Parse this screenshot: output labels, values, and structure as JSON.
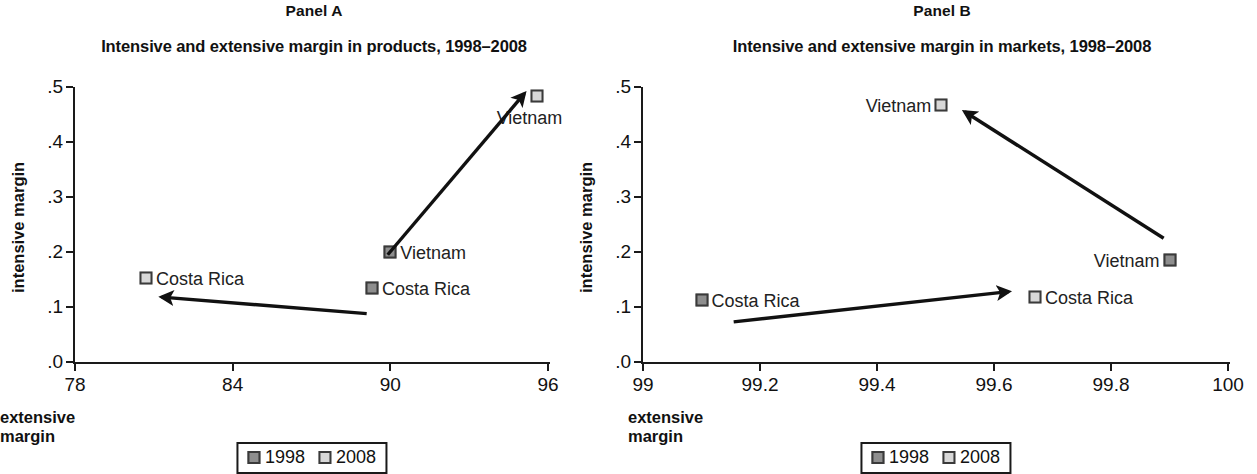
{
  "figure": {
    "background": "#ffffff",
    "marker_colors": {
      "y1998": "#8e8e8e",
      "y2008": "#d8d8d8",
      "border": "#3a3a3a"
    },
    "axis_color": "#1a1a1a"
  },
  "panels": [
    {
      "id": "panel-a",
      "label": "Panel A",
      "title": "Intensive and extensive margin in products, 1998–2008",
      "xlabel": "extensive margin",
      "ylabel": "intensive margin"
    },
    {
      "id": "panel-b",
      "label": "Panel B",
      "title": "Intensive and extensive margin in markets, 1998–2008",
      "xlabel": "extensive margin",
      "ylabel": "intensive margin"
    }
  ],
  "legend": {
    "entries": [
      {
        "label": "1998",
        "color": "#8e8e8e"
      },
      {
        "label": "2008",
        "color": "#d8d8d8"
      }
    ]
  },
  "chart_data": [
    {
      "type": "scatter",
      "panel": "Panel A",
      "title": "Intensive and extensive margin in products, 1998–2008",
      "xlabel": "extensive margin",
      "ylabel": "intensive margin",
      "xlim": [
        78,
        96
      ],
      "ylim": [
        0.0,
        0.5
      ],
      "xticks": [
        78,
        84,
        90,
        96
      ],
      "xticklabels": [
        "78",
        "84",
        "90",
        "96"
      ],
      "yticks": [
        0.0,
        0.1,
        0.2,
        0.3,
        0.4,
        0.5
      ],
      "yticklabels": [
        ".0",
        ".1",
        ".2",
        ".3",
        ".4",
        ".5"
      ],
      "grid": false,
      "legend_position": "below-center",
      "series": [
        {
          "name": "1998",
          "color": "#8e8e8e",
          "points": [
            {
              "label": "Vietnam",
              "x": 90.0,
              "y": 0.2,
              "label_side": "right"
            },
            {
              "label": "Costa Rica",
              "x": 89.3,
              "y": 0.135,
              "label_side": "right"
            }
          ]
        },
        {
          "name": "2008",
          "color": "#d8d8d8",
          "points": [
            {
              "label": "Vietnam",
              "x": 95.6,
              "y": 0.483,
              "label_side": "below"
            },
            {
              "label": "Costa Rica",
              "x": 80.7,
              "y": 0.152,
              "label_side": "right"
            }
          ]
        }
      ],
      "annotations": [
        {
          "type": "arrow",
          "name": "vietnam-arrow",
          "from": {
            "x": 89.9,
            "y": 0.195
          },
          "to": {
            "x": 95.1,
            "y": 0.488
          }
        },
        {
          "type": "arrow",
          "name": "costa-rica-arrow",
          "from": {
            "x": 89.1,
            "y": 0.088
          },
          "to": {
            "x": 81.3,
            "y": 0.118
          }
        }
      ]
    },
    {
      "type": "scatter",
      "panel": "Panel B",
      "title": "Intensive and extensive margin in markets, 1998–2008",
      "xlabel": "extensive margin",
      "ylabel": "intensive margin",
      "xlim": [
        99,
        100
      ],
      "ylim": [
        0.0,
        0.5
      ],
      "xticks": [
        99,
        99.2,
        99.4,
        99.6,
        99.8,
        100
      ],
      "xticklabels": [
        "99",
        "99.2",
        "99.4",
        "99.6",
        "99.8",
        "100"
      ],
      "yticks": [
        0.0,
        0.1,
        0.2,
        0.3,
        0.4,
        0.5
      ],
      "yticklabels": [
        ".0",
        ".1",
        ".2",
        ".3",
        ".4",
        ".5"
      ],
      "grid": false,
      "legend_position": "below-center",
      "series": [
        {
          "name": "1998",
          "color": "#8e8e8e",
          "points": [
            {
              "label": "Vietnam",
              "x": 99.9,
              "y": 0.185,
              "label_side": "left"
            },
            {
              "label": "Costa Rica",
              "x": 99.1,
              "y": 0.113,
              "label_side": "right"
            }
          ]
        },
        {
          "name": "2008",
          "color": "#d8d8d8",
          "points": [
            {
              "label": "Vietnam",
              "x": 99.51,
              "y": 0.468,
              "label_side": "left"
            },
            {
              "label": "Costa Rica",
              "x": 99.67,
              "y": 0.118,
              "label_side": "right"
            }
          ]
        }
      ],
      "annotations": [
        {
          "type": "arrow",
          "name": "vietnam-arrow",
          "from": {
            "x": 99.89,
            "y": 0.225
          },
          "to": {
            "x": 99.55,
            "y": 0.455
          }
        },
        {
          "type": "arrow",
          "name": "costa-rica-arrow",
          "from": {
            "x": 99.155,
            "y": 0.073
          },
          "to": {
            "x": 99.625,
            "y": 0.128
          }
        }
      ]
    }
  ]
}
